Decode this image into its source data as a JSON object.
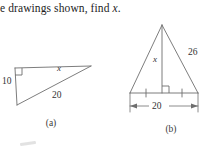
{
  "prompt": {
    "text_before": "e drawings shown, find ",
    "variable": "x",
    "text_after": "."
  },
  "figures": [
    {
      "id": "a",
      "caption": "(a)",
      "type": "right-triangle",
      "labels": {
        "vertical_leg": "10",
        "hypotenuse": "20",
        "unknown": "x"
      },
      "right_angle_marker": true
    },
    {
      "id": "b",
      "caption": "(b)",
      "type": "isosceles-triangle",
      "labels": {
        "slant_side": "26",
        "altitude": "x",
        "base": "20"
      },
      "right_angle_marker": true,
      "base_bisected_ticks": true,
      "dimension_line": true
    }
  ],
  "style": {
    "line_color": "#6e6e6e",
    "text_color": "#2b2b2b",
    "background": "#ffffff"
  }
}
